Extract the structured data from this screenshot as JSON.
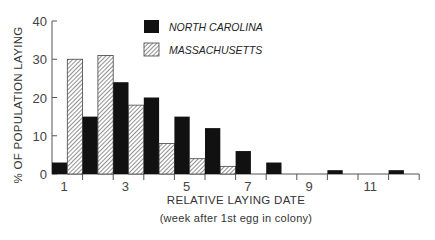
{
  "chart_data": {
    "type": "bar",
    "title": "",
    "xlabel": "RELATIVE LAYING DATE",
    "xlabel_sub": "(week after 1st egg in colony)",
    "ylabel": "% OF POPULATION LAYING",
    "ylim": [
      0,
      40
    ],
    "yticks": [
      0,
      10,
      20,
      30,
      40
    ],
    "categories": [
      1,
      2,
      3,
      4,
      5,
      6,
      7,
      8,
      9,
      10,
      11,
      12
    ],
    "xtick_labels": [
      "1",
      "3",
      "5",
      "7",
      "9",
      "11"
    ],
    "xtick_label_weeks": [
      1,
      3,
      5,
      7,
      9,
      11
    ],
    "grid": false,
    "legend_position": "top-center",
    "series": [
      {
        "name": "NORTH CAROLINA",
        "fill": "solid",
        "color": "#111111",
        "values": [
          3,
          15,
          24,
          20,
          15,
          12,
          6,
          3,
          0,
          1,
          0,
          1
        ]
      },
      {
        "name": "MASSACHUSETTS",
        "fill": "hatched",
        "color": "#555555",
        "values": [
          30,
          31,
          18,
          8,
          4,
          2,
          0,
          0,
          0,
          0,
          0,
          0
        ]
      }
    ]
  }
}
